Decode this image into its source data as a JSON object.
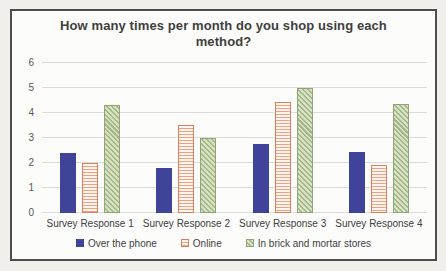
{
  "page": {
    "background_color": "#F1F0ED",
    "chart_border_color": "#4C4C4C",
    "chart_background_color": "#FCFCFB",
    "gridline_color": "#DBDBD9"
  },
  "chart_data": {
    "type": "bar",
    "title": "How many times per month do you shop using each method?",
    "categories": [
      "Survey Response 1",
      "Survey Response 2",
      "Survey Response 3",
      "Survey Response 4"
    ],
    "series": [
      {
        "name": "Over the phone",
        "values": [
          2.4,
          1.8,
          2.75,
          2.45
        ],
        "color": "#3F4399",
        "pattern": "solid"
      },
      {
        "name": "Online",
        "values": [
          2.0,
          3.5,
          4.45,
          1.9
        ],
        "color": "#DC7F5E",
        "pattern": "horizontal-stripes"
      },
      {
        "name": "In brick and mortar stores",
        "values": [
          4.3,
          3.0,
          5.0,
          4.35
        ],
        "color": "#A4B787",
        "pattern": "diagonal-hatch"
      }
    ],
    "xlabel": "",
    "ylabel": "",
    "ylim": [
      0,
      6
    ],
    "yticks": [
      0,
      1,
      2,
      3,
      4,
      5,
      6
    ],
    "grid": true,
    "legend_position": "bottom"
  }
}
